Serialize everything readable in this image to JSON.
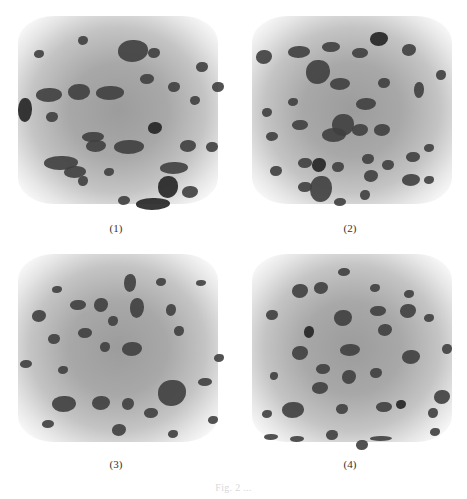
{
  "figure": {
    "panels": [
      {
        "id": 1,
        "label": "(1)",
        "description": "3D grayscale render of cubic volume with dark particle inclusions"
      },
      {
        "id": 2,
        "label": "(2)",
        "description": "3D grayscale render of cubic volume with dark particle inclusions"
      },
      {
        "id": 3,
        "label": "(3)",
        "description": "3D grayscale render of cubic volume with dark particle inclusions"
      },
      {
        "id": 4,
        "label": "(4)",
        "description": "3D grayscale render of cubic volume with dark particle inclusions"
      }
    ],
    "caption": "Fig. 2 ..."
  },
  "colors": {
    "background": "#ffffff",
    "volume_core": "#9c9c9c",
    "particles": "#3f3f3f",
    "label_text": "#333333"
  }
}
